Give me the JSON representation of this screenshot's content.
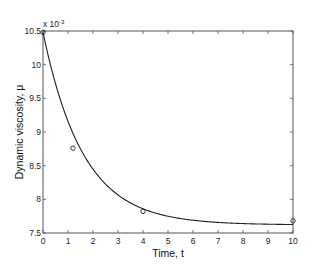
{
  "chart_data": {
    "type": "line",
    "title": "",
    "xlabel": "Time, t",
    "ylabel": "Dynamic viscosity, μ",
    "y_exponent_label": "x 10",
    "y_exponent": "-3",
    "xlim": [
      0,
      10
    ],
    "ylim": [
      7.5,
      10.5
    ],
    "x_ticks": [
      "0",
      "1",
      "2",
      "3",
      "4",
      "5",
      "6",
      "7",
      "8",
      "9",
      "10"
    ],
    "y_ticks": [
      "7.5",
      "8",
      "8.5",
      "9",
      "9.5",
      "10",
      "10.5"
    ],
    "grid": false,
    "series": [
      {
        "name": "fitted curve",
        "style": "line",
        "model": "exponential decay",
        "x": [
          0,
          0.5,
          1,
          1.5,
          2,
          2.5,
          3,
          4,
          5,
          6,
          7,
          8,
          9,
          10
        ],
        "values": [
          10.48,
          9.62,
          9.0,
          8.58,
          8.3,
          8.1,
          7.97,
          7.82,
          7.74,
          7.7,
          7.67,
          7.65,
          7.64,
          7.63
        ]
      },
      {
        "name": "measured",
        "style": "markers-circle",
        "x": [
          0,
          1.2,
          4,
          10
        ],
        "values": [
          10.48,
          8.76,
          7.82,
          7.68
        ]
      }
    ]
  }
}
